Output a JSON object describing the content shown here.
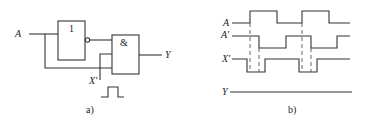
{
  "circuit": {
    "caption": "a)",
    "input_label": "A",
    "noise_label": "X'",
    "output_label": "Y",
    "not_gate_symbol": "1",
    "and_gate_symbol": "&",
    "pulse_icon": "pulse-icon"
  },
  "timing": {
    "caption": "b)",
    "signals": [
      {
        "name": "A",
        "label": "A"
      },
      {
        "name": "A_prime",
        "label": "A'"
      },
      {
        "name": "X_prime",
        "label": "X'"
      },
      {
        "name": "Y",
        "label": "Y"
      }
    ]
  },
  "colors": {
    "line": "#333333",
    "background": "#ffffff"
  }
}
